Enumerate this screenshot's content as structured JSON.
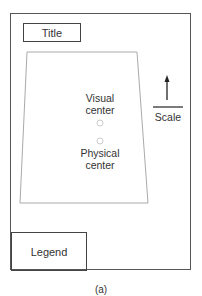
{
  "figure": {
    "title_box": "Title",
    "legend_box": "Legend",
    "scale_label": "Scale",
    "visual_center_label": [
      "Visual",
      "center"
    ],
    "physical_center_label": [
      "Physical",
      "center"
    ],
    "caption": "(a)"
  },
  "colors": {
    "frame": "#555555",
    "map_outline": "#aaaaaa",
    "center_markers": "#cccccc"
  }
}
